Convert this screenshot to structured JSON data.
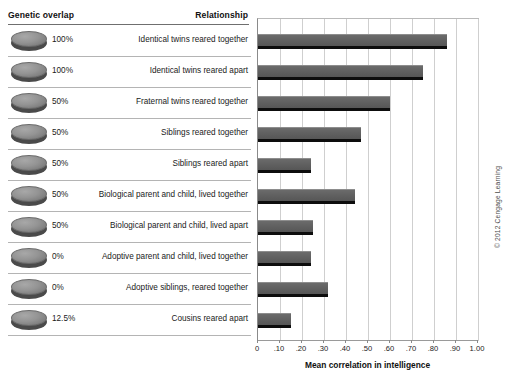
{
  "table": {
    "headers": {
      "genetic_overlap": "Genetic overlap",
      "relationship": "Relationship"
    },
    "rows": [
      {
        "overlap": "100%",
        "relationship": "Identical twins reared together",
        "icon": "gray-disc-icon"
      },
      {
        "overlap": "100%",
        "relationship": "Identical twins reared apart",
        "icon": "gray-disc-icon"
      },
      {
        "overlap": "50%",
        "relationship": "Fraternal twins reared together",
        "icon": "gray-disc-icon"
      },
      {
        "overlap": "50%",
        "relationship": "Siblings reared together",
        "icon": "gray-disc-icon"
      },
      {
        "overlap": "50%",
        "relationship": "Siblings reared apart",
        "icon": "gray-disc-icon"
      },
      {
        "overlap": "50%",
        "relationship": "Biological parent and child, lived together",
        "icon": "gray-disc-icon"
      },
      {
        "overlap": "50%",
        "relationship": "Biological parent and child, lived apart",
        "icon": "gray-disc-icon"
      },
      {
        "overlap": "0%",
        "relationship": "Adoptive parent and child, lived together",
        "icon": "gray-disc-icon"
      },
      {
        "overlap": "0%",
        "relationship": "Adoptive siblings, reared together",
        "icon": "gray-disc-icon"
      },
      {
        "overlap": "12.5%",
        "relationship": "Cousins reared apart",
        "icon": "gray-disc-icon"
      }
    ]
  },
  "chart_data": {
    "type": "bar",
    "orientation": "horizontal",
    "title": "",
    "xlabel": "Mean correlation in intelligence",
    "ylabel": "",
    "xlim": [
      0,
      1.0
    ],
    "xticks": [
      0,
      0.1,
      0.2,
      0.3,
      0.4,
      0.5,
      0.6,
      0.7,
      0.8,
      0.9,
      1.0
    ],
    "xtick_labels": [
      "0",
      ".10",
      ".20",
      ".30",
      ".40",
      ".50",
      ".60",
      ".70",
      ".80",
      ".90",
      "1.00"
    ],
    "grid": "vertical",
    "legend": "none",
    "categories": [
      "Identical twins reared together",
      "Identical twins reared apart",
      "Fraternal twins reared together",
      "Siblings reared together",
      "Siblings reared apart",
      "Biological parent and child, lived together",
      "Biological parent and child, lived apart",
      "Adoptive parent and child, lived together",
      "Adoptive siblings, reared together",
      "Cousins reared apart"
    ],
    "values": [
      0.86,
      0.75,
      0.6,
      0.47,
      0.24,
      0.44,
      0.25,
      0.24,
      0.32,
      0.15
    ],
    "bar_color": "#5e5e5e"
  },
  "credit": "© 2012 Cengage Learning"
}
